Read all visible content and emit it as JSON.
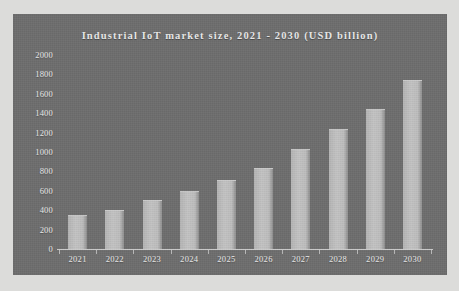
{
  "chart_data": {
    "type": "bar",
    "title": "Industrial IoT market size, 2021 - 2030 (USD billion)",
    "xlabel": "",
    "ylabel": "",
    "categories": [
      "2021",
      "2022",
      "2023",
      "2024",
      "2025",
      "2026",
      "2027",
      "2028",
      "2029",
      "2030"
    ],
    "values": [
      340,
      390,
      500,
      590,
      700,
      825,
      1020,
      1230,
      1435,
      1730
    ],
    "ylim": [
      0,
      2000
    ],
    "yticks": [
      0,
      200,
      400,
      600,
      800,
      1000,
      1200,
      1400,
      1600,
      1800,
      2000
    ],
    "ytick_labels": [
      "0",
      "200",
      "400",
      "600",
      "800",
      "1000",
      "1200",
      "1400",
      "1600",
      "1800",
      "2000"
    ],
    "grid": false,
    "legend": null,
    "series": [
      {
        "name": "Industrial IoT market size",
        "values": [
          340,
          390,
          500,
          590,
          700,
          825,
          1020,
          1230,
          1435,
          1730
        ]
      }
    ]
  },
  "style": {
    "panel_background": "#6e6e6e",
    "page_background": "#dcdcda",
    "bar_color": "#bdbdbd",
    "text_color": "#ececec",
    "axis_color": "#cfcfcf"
  }
}
